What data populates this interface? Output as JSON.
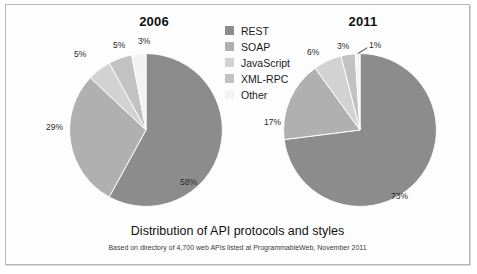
{
  "figure": {
    "title": "Distribution of API protocols and styles",
    "subtitle": "Based on directory of 4,700 web APIs listed at ProgrammableWeb, November 2011",
    "border_color": "#b9b9b9"
  },
  "legend": {
    "items": [
      {
        "label": "REST",
        "color": "#8c8c8c"
      },
      {
        "label": "SOAP",
        "color": "#b0b0b0"
      },
      {
        "label": "JavaScript",
        "color": "#d2d2d2"
      },
      {
        "label": "XML-RPC",
        "color": "#c2c2c2"
      },
      {
        "label": "Other",
        "color": "#f2f2f2"
      }
    ]
  },
  "panels": [
    {
      "year": "2006"
    },
    {
      "year": "2011"
    }
  ],
  "labels_2006": {
    "rest": "58%",
    "soap": "29%",
    "javascript": "5%",
    "xmlrpc": "5%",
    "other": "3%"
  },
  "labels_2011": {
    "rest": "73%",
    "soap": "17%",
    "javascript": "6%",
    "xmlrpc": "3%",
    "other": "1%"
  },
  "chart_data": [
    {
      "type": "pie",
      "title": "2006",
      "categories": [
        "REST",
        "SOAP",
        "JavaScript",
        "XML-RPC",
        "Other"
      ],
      "values": [
        58,
        29,
        5,
        5,
        3
      ],
      "value_labels": [
        "58%",
        "29%",
        "5%",
        "5%",
        "3%"
      ],
      "colors": [
        "#8c8c8c",
        "#b0b0b0",
        "#d2d2d2",
        "#c2c2c2",
        "#f2f2f2"
      ],
      "units": "percent",
      "start_angle_deg": 0,
      "direction": "clockwise",
      "legend_position": "center",
      "grid": false
    },
    {
      "type": "pie",
      "title": "2011",
      "categories": [
        "REST",
        "SOAP",
        "JavaScript",
        "XML-RPC",
        "Other"
      ],
      "values": [
        73,
        17,
        6,
        3,
        1
      ],
      "value_labels": [
        "73%",
        "17%",
        "6%",
        "3%",
        "1%"
      ],
      "colors": [
        "#8c8c8c",
        "#b0b0b0",
        "#d2d2d2",
        "#c2c2c2",
        "#f2f2f2"
      ],
      "units": "percent",
      "start_angle_deg": 0,
      "direction": "clockwise",
      "legend_position": "center",
      "grid": false
    }
  ]
}
